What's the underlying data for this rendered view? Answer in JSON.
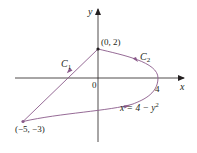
{
  "figure": {
    "axes": {
      "x_label": "x",
      "y_label": "y",
      "origin_label": "0",
      "x_tick_label": "4"
    },
    "points": [
      {
        "label": "(0, 2)",
        "x": 0,
        "y": 2
      },
      {
        "label": "(−5, −3)",
        "x": -5,
        "y": -3
      },
      {
        "label": "4",
        "x": 4,
        "y": 0
      }
    ],
    "curves": [
      {
        "name": "C1",
        "label_main": "C",
        "label_sub": "1",
        "type": "line segment",
        "from": [
          -5,
          -3
        ],
        "to": [
          0,
          2
        ]
      },
      {
        "name": "C2",
        "label_main": "C",
        "label_sub": "2",
        "type": "parabola",
        "equation": "x = 4 − y²",
        "from": [
          0,
          2
        ],
        "to": [
          -5,
          -3
        ]
      }
    ],
    "equation_label": {
      "lhs": "x = 4 − y",
      "exp": "2"
    },
    "colors": {
      "curve": "#8a5a8a",
      "axis": "#231f20",
      "text": "#231f20"
    }
  }
}
